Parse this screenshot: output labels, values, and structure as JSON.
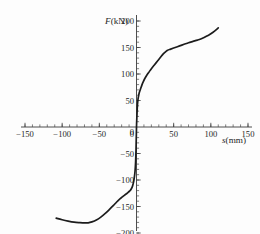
{
  "chart_data": {
    "type": "line",
    "title": "",
    "xlabel": "s(mm)",
    "ylabel": "F(kN)",
    "xlim": [
      -150,
      150
    ],
    "ylim": [
      -200,
      200
    ],
    "grid": false,
    "legend": "none",
    "x_ticks": [
      -150,
      -100,
      -50,
      0,
      50,
      100,
      150
    ],
    "x_tick_labels": [
      "−150",
      "−100",
      "−50",
      "0",
      "50",
      "100",
      "150"
    ],
    "y_ticks": [
      -200,
      -150,
      -100,
      -50,
      0,
      50,
      100,
      150,
      200
    ],
    "y_tick_labels": [
      "−200",
      "−150",
      "−100",
      "−50",
      "0",
      "50",
      "100",
      "150",
      "200"
    ],
    "x_minor_tick_step": 10,
    "y_minor_tick_step": 10,
    "series": [
      {
        "name": "load-slip",
        "color": "#1c1c1c",
        "x": [
          -108,
          -100,
          -92,
          -84,
          -76,
          -70,
          -65,
          -60,
          -54,
          -48,
          -42,
          -36,
          -31,
          -27,
          -23,
          -19,
          -16,
          -13,
          -11,
          -9,
          -7.5,
          -6,
          -5,
          -4,
          -3,
          -2,
          -1.2,
          -0.6,
          0,
          0.6,
          1.2,
          2,
          3,
          4,
          5.5,
          7,
          9,
          11,
          14,
          17,
          20,
          24,
          28,
          32,
          36,
          40,
          42,
          46,
          52,
          58,
          64,
          70,
          76,
          82,
          88,
          94,
          100,
          105,
          110
        ],
        "y": [
          -172,
          -175,
          -177.5,
          -179.5,
          -180.5,
          -181,
          -180.8,
          -179,
          -175.5,
          -170,
          -163,
          -155,
          -148,
          -142,
          -136.5,
          -132,
          -128.5,
          -125.5,
          -123,
          -120.5,
          -118,
          -114,
          -110,
          -104,
          -96,
          -84,
          -66,
          -40,
          0,
          22,
          40,
          52,
          60,
          66,
          72,
          78,
          85,
          91,
          98,
          104,
          110,
          117,
          124,
          131,
          138,
          143,
          145,
          147,
          150,
          153,
          156,
          159,
          161.5,
          164,
          167,
          171,
          176,
          181,
          187
        ]
      }
    ],
    "annotations": []
  },
  "axes": {
    "y_axis_name": "F(kN)",
    "x_axis_name": "s(mm)",
    "x_axis_variable": "s",
    "x_axis_unit": "(mm)",
    "y_axis_variable": "F",
    "y_axis_unit": "(kN)"
  },
  "style": {
    "background": "#fdfdfd",
    "curve_color": "#1c1c1c",
    "axis_color": "#3a3a3a",
    "text_color": "#1f1f1f"
  }
}
